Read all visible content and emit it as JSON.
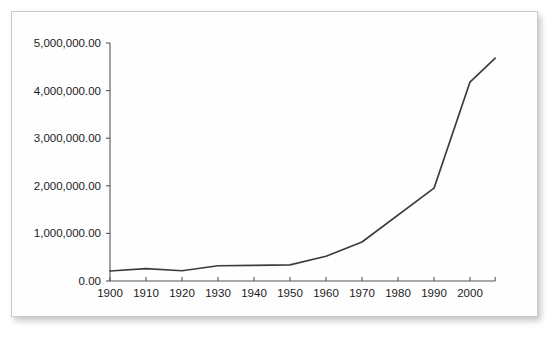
{
  "chart_data": {
    "type": "line",
    "title": "",
    "subtitle": "",
    "xlabel": "",
    "ylabel": "",
    "grid": false,
    "legend": false,
    "legend_position": "none",
    "xlim": [
      1900,
      2007
    ],
    "ylim": [
      0,
      5000000
    ],
    "x_tick_labels": [
      "1900",
      "1910",
      "1920",
      "1930",
      "1940",
      "1950",
      "1960",
      "1970",
      "1980",
      "1990",
      "2000"
    ],
    "x_ticks": [
      1900,
      1910,
      1920,
      1930,
      1940,
      1950,
      1960,
      1970,
      1980,
      1990,
      2000
    ],
    "y_tick_labels": [
      "0.00",
      "1,000,000.00",
      "2,000,000.00",
      "3,000,000.00",
      "4,000,000.00",
      "5,000,000.00"
    ],
    "y_ticks": [
      0,
      1000000,
      2000000,
      3000000,
      4000000,
      5000000
    ],
    "x": [
      1900,
      1910,
      1920,
      1930,
      1940,
      1950,
      1960,
      1970,
      1990,
      2000,
      2007
    ],
    "values": [
      210000,
      260000,
      215000,
      320000,
      330000,
      340000,
      520000,
      820000,
      1950000,
      4180000,
      4680000
    ],
    "series": [
      {
        "name": "series-1",
        "color": "#3c3c3c",
        "x": [
          1900,
          1910,
          1920,
          1930,
          1940,
          1950,
          1960,
          1970,
          1990,
          2000,
          2007
        ],
        "values": [
          210000,
          260000,
          215000,
          320000,
          330000,
          340000,
          520000,
          820000,
          1950000,
          4180000,
          4680000
        ]
      }
    ]
  },
  "style": {
    "line_color": "#3c3c3c",
    "axis_color": "#555555",
    "text_color": "#1b1b1b",
    "card_background": "#fefefe",
    "card_border": "#c9c9c9",
    "page_background": "#ffffff"
  }
}
